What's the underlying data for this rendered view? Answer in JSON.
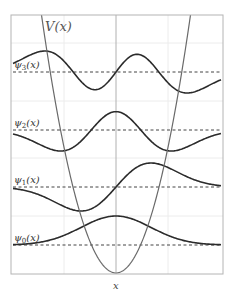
{
  "chart_data": {
    "type": "line",
    "title": "",
    "xlabel": "x",
    "ylabel": "",
    "potential_label": "V(x)",
    "grid": true,
    "frame": {
      "left": 11,
      "top": 15,
      "right": 223,
      "bottom": 274
    },
    "center_x": 116,
    "x_scale_px_per_unit": 35,
    "potential": {
      "type": "parabola",
      "vertex_y_px": 273,
      "crosses_top_at_x_px": [
        42,
        191
      ]
    },
    "series": [
      {
        "name": "ψ0(x)",
        "n": 0,
        "baseline_y_px": 245,
        "amplitude_px": 29,
        "sign": 1
      },
      {
        "name": "ψ1(x)",
        "n": 1,
        "baseline_y_px": 187,
        "amplitude_px": 24,
        "sign": 1
      },
      {
        "name": "ψ2(x)",
        "n": 2,
        "baseline_y_px": 130,
        "amplitude_px": 21,
        "sign": -1
      },
      {
        "name": "ψ3(x)",
        "n": 3,
        "baseline_y_px": 72,
        "amplitude_px": 21,
        "sign": -1
      }
    ],
    "grid_lines": {
      "x_px": [
        64,
        168
      ],
      "y_px": [
        43,
        101,
        158,
        216
      ]
    }
  },
  "labels": {
    "potential": {
      "main": "V(x)"
    },
    "x_axis": "x",
    "psi": [
      {
        "base": "ψ",
        "sub": "0",
        "tail": "(x)"
      },
      {
        "base": "ψ",
        "sub": "1",
        "tail": "(x)"
      },
      {
        "base": "ψ",
        "sub": "2",
        "tail": "(x)"
      },
      {
        "base": "ψ",
        "sub": "3",
        "tail": "(x)"
      }
    ]
  }
}
